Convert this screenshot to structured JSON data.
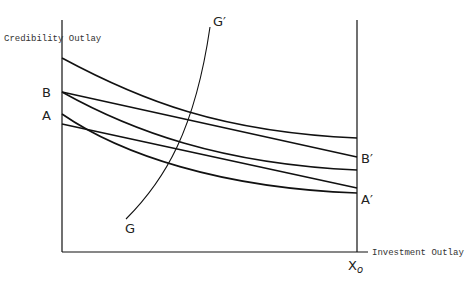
{
  "diagram": {
    "y_axis_label": "Credibility Outlay",
    "x_axis_label": "Investment Outlay",
    "labels": {
      "B": "B",
      "A": "A",
      "B_prime": "B′",
      "A_prime": "A′",
      "G": "G",
      "G_prime": "G′",
      "X0": "X",
      "X0_sub": "o"
    },
    "lines": [
      {
        "name": "upper-curve",
        "type": "curve",
        "from": [
          62,
          58
        ],
        "to": [
          357,
          138
        ]
      },
      {
        "name": "B-B-prime",
        "type": "straight",
        "from": [
          62,
          92
        ],
        "to": [
          357,
          157
        ]
      },
      {
        "name": "middle-curve",
        "type": "curve",
        "from": [
          62,
          92
        ],
        "to": [
          357,
          170
        ]
      },
      {
        "name": "A-A-prime",
        "type": "straight",
        "from": [
          62,
          124
        ],
        "to": [
          357,
          188
        ]
      },
      {
        "name": "lower-curve",
        "type": "curve",
        "from": [
          62,
          114
        ],
        "to": [
          357,
          193
        ]
      },
      {
        "name": "G-G-prime",
        "type": "curve",
        "from": [
          126,
          219
        ],
        "to": [
          210,
          27
        ]
      }
    ],
    "colors": {
      "line": "#111111",
      "background": "#ffffff"
    }
  }
}
